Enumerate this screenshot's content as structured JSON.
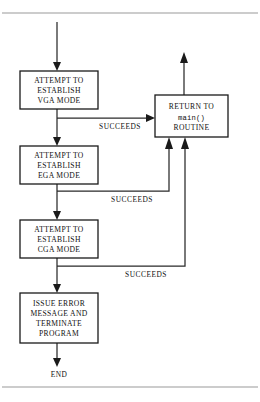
{
  "figure": {
    "background_color": "#ffffff",
    "line_color": "#2a2a2a",
    "box_stroke_color": "#1a1a1a",
    "rule_color": "#9a9a9a",
    "text_color": "#111111"
  },
  "nodes": {
    "vga": {
      "id": "attempt-vga",
      "shape": "process",
      "line1": "ATTEMPT TO",
      "line2": "ESTABLISH",
      "line3": "VGA MODE",
      "x": 20,
      "y": 71,
      "width": 78,
      "height": 38
    },
    "ega": {
      "id": "attempt-ega",
      "shape": "process",
      "line1": "ATTEMPT TO",
      "line2": "ESTABLISH",
      "line3": "EGA MODE",
      "x": 20,
      "y": 146,
      "width": 78,
      "height": 38
    },
    "cga": {
      "id": "attempt-cga",
      "shape": "process",
      "line1": "ATTEMPT TO",
      "line2": "ESTABLISH",
      "line3": "CGA MODE",
      "x": 20,
      "y": 220,
      "width": 78,
      "height": 38
    },
    "error": {
      "id": "issue-error",
      "shape": "process",
      "line1": "ISSUE ERROR",
      "line2": "MESSAGE AND",
      "line3": "TERMINATE",
      "line4": "PROGRAM",
      "x": 20,
      "y": 293,
      "width": 78,
      "height": 50
    },
    "return": {
      "id": "return-to-main",
      "shape": "process",
      "line1": "RETURN TO",
      "line2": "main()",
      "line3": "ROUTINE",
      "x": 155,
      "y": 95,
      "width": 73,
      "height": 42
    },
    "end": {
      "id": "end-terminal",
      "shape": "terminal-label",
      "label": "END",
      "x": 59,
      "y": 374
    }
  },
  "edges": {
    "entry": {
      "name": "entry-arrow",
      "from": "top-of-page",
      "to": "attempt-vga"
    },
    "vga_to_ega": {
      "name": "vga-fail-to-ega",
      "label": ""
    },
    "ega_to_cga": {
      "name": "ega-fail-to-cga",
      "label": ""
    },
    "cga_to_error": {
      "name": "cga-fail-to-error",
      "label": ""
    },
    "error_to_end": {
      "name": "error-to-end",
      "label": ""
    },
    "vga_succeeds": {
      "name": "vga-succeeds-branch",
      "label": "SUCCEEDS",
      "label_x": 120,
      "label_y": 126
    },
    "ega_succeeds": {
      "name": "ega-succeeds-branch",
      "label": "SUCCEEDS",
      "label_x": 132,
      "label_y": 199
    },
    "cga_succeeds": {
      "name": "cga-succeeds-branch",
      "label": "SUCCEEDS",
      "label_x": 146,
      "label_y": 274
    },
    "return_exit": {
      "name": "return-exit-arrow",
      "label": ""
    }
  },
  "rules": {
    "top_rule_y": 13,
    "bottom_rule_y": 387
  }
}
